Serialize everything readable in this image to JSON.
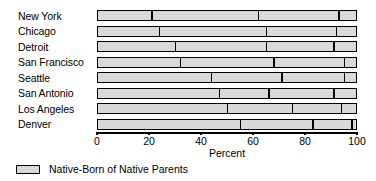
{
  "chart_data": {
    "type": "bar",
    "orientation": "horizontal",
    "stacked": true,
    "title": "",
    "xlabel": "Percent",
    "ylabel": "",
    "xlim": [
      0,
      100
    ],
    "xticks": [
      0,
      20,
      40,
      60,
      80,
      100
    ],
    "xtick_labels": [
      "0",
      "20",
      "40",
      "60",
      "80",
      "100"
    ],
    "grid": false,
    "legend_position": "below-left",
    "legend": [
      {
        "label": "Native-Born of Native Parents",
        "color": "#d9d9d9"
      }
    ],
    "categories": [
      "New York",
      "Chicago",
      "Detroit",
      "San Francisco",
      "Seattle",
      "San Antonio",
      "Los Angeles",
      "Denver"
    ],
    "segment_boundaries": [
      [
        21,
        62,
        93
      ],
      [
        24,
        65,
        92
      ],
      [
        30,
        65,
        91
      ],
      [
        32,
        68,
        95
      ],
      [
        44,
        71,
        95
      ],
      [
        47,
        66,
        91
      ],
      [
        50,
        75,
        94
      ],
      [
        55,
        83,
        98
      ]
    ],
    "series": [
      {
        "name": "Native-Born of Native Parents",
        "values": [
          21,
          24,
          30,
          32,
          44,
          47,
          50,
          55
        ],
        "color": "#d9d9d9"
      },
      {
        "name": "Segment 2",
        "values": [
          41,
          41,
          35,
          36,
          27,
          19,
          25,
          28
        ],
        "color": "#d9d9d9"
      },
      {
        "name": "Segment 3",
        "values": [
          31,
          27,
          26,
          27,
          24,
          25,
          19,
          15
        ],
        "color": "#d9d9d9"
      },
      {
        "name": "Segment 4",
        "values": [
          7,
          8,
          9,
          5,
          5,
          9,
          6,
          2
        ],
        "color": "#d9d9d9"
      }
    ]
  },
  "colors": {
    "bar_fill": "#d9d9d9",
    "outline": "#000000",
    "background": "#ffffff"
  }
}
